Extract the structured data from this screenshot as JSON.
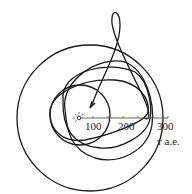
{
  "diagram": {
    "axis": {
      "tick_labels": [
        "100",
        "200",
        "300"
      ],
      "unit_label": "тыс. a.e."
    },
    "unit_short": "т a.e.",
    "center_symbol": "sun",
    "colors": {
      "line": "#1a1a1a",
      "background": "#ffffff"
    }
  }
}
